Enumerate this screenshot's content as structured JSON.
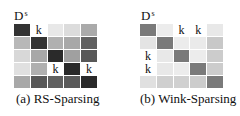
{
  "figure": {
    "panels": [
      {
        "id": "a",
        "matrix_label": {
          "base": "D",
          "superscript": "s"
        },
        "caption": "(a) RS-Sparsing",
        "cells": [
          [
            {
              "shade": "#333333",
              "text": ""
            },
            {
              "shade": "#ffffff",
              "text": "k"
            },
            {
              "shade": "#e8e8e8",
              "text": ""
            },
            {
              "shade": "#dcdcdc",
              "text": ""
            },
            {
              "shade": "#aaaaaa",
              "text": ""
            }
          ],
          [
            {
              "shade": "#b8b8b8",
              "text": ""
            },
            {
              "shade": "#333333",
              "text": ""
            },
            {
              "shade": "#b0b0b0",
              "text": ""
            },
            {
              "shade": "#a8a8a8",
              "text": ""
            },
            {
              "shade": "#606060",
              "text": ""
            }
          ],
          [
            {
              "shade": "#d8d8d8",
              "text": ""
            },
            {
              "shade": "#a8a8a8",
              "text": ""
            },
            {
              "shade": "#2a2a2a",
              "text": ""
            },
            {
              "shade": "#a0a0a0",
              "text": ""
            },
            {
              "shade": "#585858",
              "text": ""
            }
          ],
          [
            {
              "shade": "#e0e0e0",
              "text": ""
            },
            {
              "shade": "#b0b0b0",
              "text": ""
            },
            {
              "shade": "#ffffff",
              "text": "k"
            },
            {
              "shade": "#2a2a2a",
              "text": ""
            },
            {
              "shade": "#ffffff",
              "text": "k"
            }
          ],
          [
            {
              "shade": "#a8a8a8",
              "text": ""
            },
            {
              "shade": "#585858",
              "text": ""
            },
            {
              "shade": "#606060",
              "text": ""
            },
            {
              "shade": "#5a5a5a",
              "text": ""
            },
            {
              "shade": "#2a2a2a",
              "text": ""
            }
          ]
        ]
      },
      {
        "id": "b",
        "matrix_label": {
          "base": "D",
          "superscript": "s"
        },
        "caption": "(b) Wink-Sparsing",
        "cells": [
          [
            {
              "shade": "#7a7a7a",
              "text": ""
            },
            {
              "shade": "#ececec",
              "text": ""
            },
            {
              "shade": "#ffffff",
              "text": "k"
            },
            {
              "shade": "#ffffff",
              "text": "k"
            },
            {
              "shade": "#e8e8e8",
              "text": ""
            }
          ],
          [
            {
              "shade": "#e4e4e4",
              "text": ""
            },
            {
              "shade": "#7a7a7a",
              "text": ""
            },
            {
              "shade": "#ececec",
              "text": ""
            },
            {
              "shade": "#eaeaea",
              "text": ""
            },
            {
              "shade": "#c8c8c8",
              "text": ""
            }
          ],
          [
            {
              "shade": "#ffffff",
              "text": "k"
            },
            {
              "shade": "#e8e8e8",
              "text": ""
            },
            {
              "shade": "#7a7a7a",
              "text": ""
            },
            {
              "shade": "#ececec",
              "text": ""
            },
            {
              "shade": "#cccccc",
              "text": ""
            }
          ],
          [
            {
              "shade": "#ffffff",
              "text": "k"
            },
            {
              "shade": "#e8e8e8",
              "text": ""
            },
            {
              "shade": "#ececec",
              "text": ""
            },
            {
              "shade": "#7a7a7a",
              "text": ""
            },
            {
              "shade": "#cccccc",
              "text": ""
            }
          ],
          [
            {
              "shade": "#e0e0e0",
              "text": ""
            },
            {
              "shade": "#cfcfcf",
              "text": ""
            },
            {
              "shade": "#d0d0d0",
              "text": ""
            },
            {
              "shade": "#cccccc",
              "text": ""
            },
            {
              "shade": "#7a7a7a",
              "text": ""
            }
          ]
        ]
      }
    ]
  }
}
